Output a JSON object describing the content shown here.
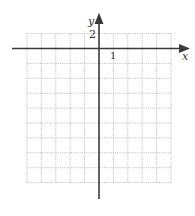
{
  "diagram": {
    "type": "coordinate-grid",
    "axes": {
      "x_label": "x",
      "y_label": "y",
      "x_tick_label": "1",
      "y_tick_label": "2"
    },
    "grid": {
      "columns_left_of_y_axis": 5,
      "columns_right_of_y_axis": 5,
      "rows_above_x_axis": 1,
      "rows_below_x_axis": 9,
      "x_unit_per_cell": 1,
      "y_unit_per_cell": 2,
      "line_style": "dotted"
    },
    "colors": {
      "background": "#ffffff",
      "grid_line": "#b8b8b8",
      "axis": "#3a3a3a",
      "label": "#333333"
    }
  }
}
